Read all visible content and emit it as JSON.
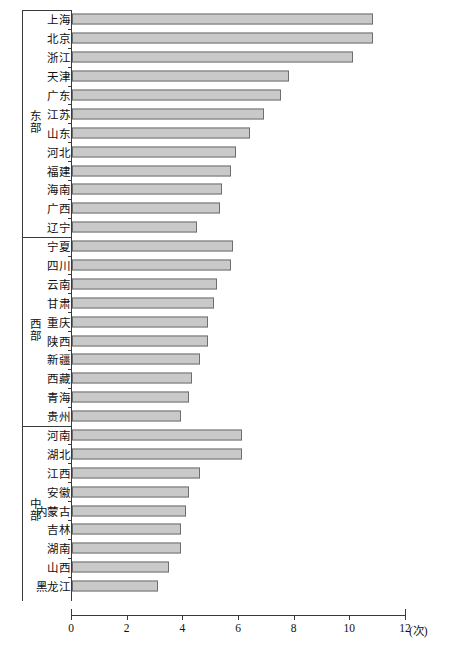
{
  "chart_data": {
    "type": "bar",
    "orientation": "horizontal",
    "title": "",
    "xlabel": "(次)",
    "ylabel": "",
    "xlim": [
      0,
      12
    ],
    "xticks": [
      0,
      2,
      4,
      6,
      8,
      10,
      12
    ],
    "xtick_labels": [
      "0",
      "2",
      "4",
      "6",
      "8",
      "10",
      "12"
    ],
    "unit_label": "(次)",
    "grid": false,
    "legend": false,
    "bar_fill": "#c9c9c9",
    "bar_border": "#6e6e6e",
    "groups": [
      {
        "name": "东部",
        "name_chars": [
          "东",
          "部"
        ],
        "categories": [
          "上海",
          "北京",
          "浙江",
          "天津",
          "广东",
          "江苏",
          "山东",
          "河北",
          "福建",
          "海南",
          "广西",
          "辽宁"
        ],
        "values": [
          10.8,
          10.8,
          10.1,
          7.8,
          7.5,
          6.9,
          6.4,
          5.9,
          5.7,
          5.4,
          5.3,
          4.5
        ]
      },
      {
        "name": "西部",
        "name_chars": [
          "西",
          "部"
        ],
        "categories": [
          "宁夏",
          "四川",
          "云南",
          "甘肃",
          "重庆",
          "陕西",
          "新疆",
          "西藏",
          "青海",
          "贵州"
        ],
        "values": [
          5.8,
          5.7,
          5.2,
          5.1,
          4.9,
          4.9,
          4.6,
          4.3,
          4.2,
          3.9
        ]
      },
      {
        "name": "中部",
        "name_chars": [
          "中",
          "部"
        ],
        "categories": [
          "河南",
          "湖北",
          "江西",
          "安徽",
          "内蒙古",
          "吉林",
          "湖南",
          "山西",
          "黑龙江"
        ],
        "values": [
          6.1,
          6.1,
          4.6,
          4.2,
          4.1,
          3.9,
          3.9,
          3.5,
          3.1
        ]
      }
    ]
  }
}
